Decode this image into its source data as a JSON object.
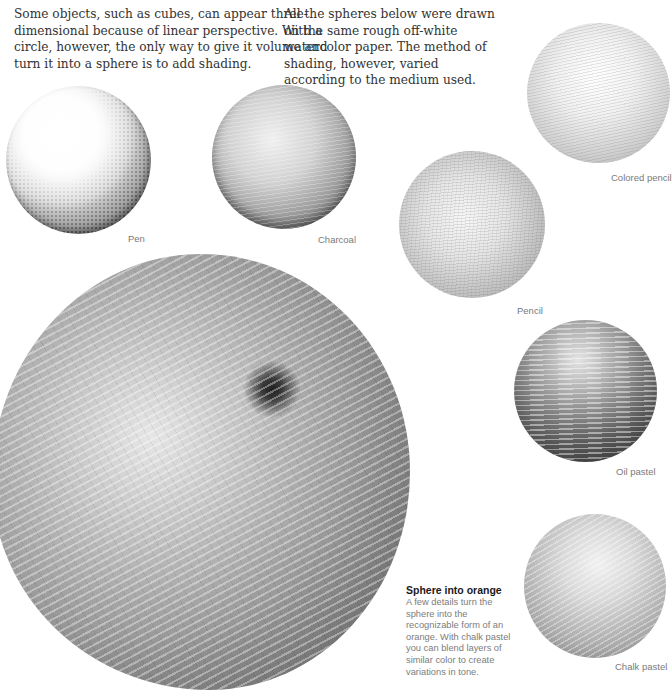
{
  "intro": {
    "left_paragraph": "Some objects, such as cubes, can appear three-dimensional because of linear perspective. With a circle, however, the only way to give it volume and turn it into a sphere is to add shading.",
    "right_paragraph": "All the spheres below were drawn on the same rough off-white watercolor paper. The method of shading, however, varied according to the medium used."
  },
  "spheres": [
    {
      "id": "pen",
      "label": "Pen"
    },
    {
      "id": "charcoal",
      "label": "Charcoal"
    },
    {
      "id": "colored-pencil",
      "label": "Colored pencil"
    },
    {
      "id": "pencil",
      "label": "Pencil"
    },
    {
      "id": "oil-pastel",
      "label": "Oil pastel"
    },
    {
      "id": "chalk-pastel",
      "label": "Chalk pastel"
    }
  ],
  "caption": {
    "title": "Sphere into orange",
    "body": "A few details turn the sphere into the recognizable form of an orange. With chalk pastel you can blend layers of similar color to create variations in tone."
  }
}
